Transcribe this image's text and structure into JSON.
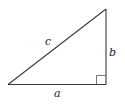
{
  "diagram": {
    "stroke_color": "#3a3a3a",
    "vertices": {
      "left": [
        8,
        84.5
      ],
      "right_angle": [
        106,
        84.5
      ],
      "top": [
        106,
        9
      ]
    },
    "right_angle_marker": {
      "x": 96.5,
      "y": 75.5,
      "size": 9.5
    },
    "labels": {
      "hypotenuse": "c",
      "vertical_leg": "b",
      "horizontal_leg": "a"
    },
    "label_positions": {
      "hypotenuse": [
        48,
        45
      ],
      "vertical_leg": [
        110,
        56
      ],
      "horizontal_leg": [
        56,
        97
      ]
    }
  }
}
